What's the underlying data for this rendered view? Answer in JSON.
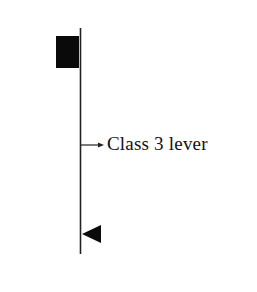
{
  "diagram": {
    "title": "Class 3 lever",
    "label": "Class 3 lever",
    "colors": {
      "line": "#222222",
      "effort_block": "#0a0a0a",
      "fulcrum": "#0a0a0a",
      "text": "#111111",
      "background": "#ffffff"
    },
    "elements": [
      {
        "name": "lever-bar",
        "type": "vertical-line",
        "x": 80,
        "y_start": 28,
        "y_end": 254
      },
      {
        "name": "load-block",
        "type": "filled-rectangle",
        "x": 56,
        "y": 36,
        "width": 23,
        "height": 32
      },
      {
        "name": "effort-arrow",
        "type": "arrow",
        "from_x": 80,
        "to_x": 104,
        "y": 145,
        "direction": "right"
      },
      {
        "name": "fulcrum-triangle",
        "type": "filled-triangle",
        "pointing": "left",
        "tip_x": 82,
        "base_x": 101,
        "y_center": 234
      }
    ]
  }
}
